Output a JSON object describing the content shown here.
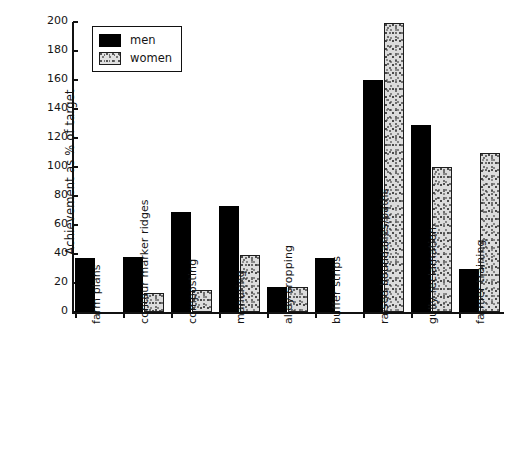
{
  "chart_data": {
    "type": "bar",
    "title": "",
    "subtitle": "",
    "xlabel": "",
    "ylabel": "Achievement as % of target",
    "ylim": [
      0,
      200
    ],
    "ytick_step": 20,
    "yticks": [
      0,
      20,
      40,
      60,
      80,
      100,
      120,
      140,
      160,
      180,
      200
    ],
    "ytick_labels": [
      "0",
      "20",
      "40",
      "60",
      "80",
      "100",
      "120",
      "140",
      "160",
      "180",
      "200"
    ],
    "grid": false,
    "legend_position": "upper-left-inside",
    "categories": [
      "farm plans",
      "contour marker ridges",
      "composting",
      "manuring",
      "alley cropping",
      "buffer strips",
      "raised boundaries/paths",
      "gully reclamation",
      "farmer training"
    ],
    "series": [
      {
        "name": "men",
        "color": "#000000",
        "values": [
          37,
          38,
          69,
          73,
          17,
          37,
          160,
          129,
          30
        ]
      },
      {
        "name": "women",
        "color": "#dcdcdc",
        "values": [
          0,
          13,
          15,
          39,
          17,
          0,
          199,
          100,
          110
        ]
      }
    ]
  },
  "legend": {
    "entries": [
      {
        "label": "men",
        "swatch": "solid-black-swatch"
      },
      {
        "label": "women",
        "swatch": "stippled-light-swatch"
      }
    ]
  },
  "axis": {
    "y_title": "Achievement as % of target"
  }
}
